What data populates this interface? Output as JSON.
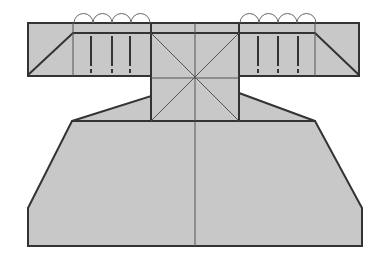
{
  "diagram": {
    "colors": {
      "fill": "#c8c8c8",
      "stroke": "#333333",
      "thin_stroke": "#555555",
      "background": "#ffffff"
    },
    "top_beam": {
      "arcs_per_side": 4,
      "dashed_marks_per_side": 3
    },
    "center_block": {
      "has_cross_diagonals": true
    },
    "base": {
      "shape": "trapezoid-with-vertical-sides"
    }
  }
}
